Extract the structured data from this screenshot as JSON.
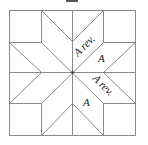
{
  "diagram": {
    "type": "eight-pointed star quilt block",
    "labels": [
      {
        "text": "A rev.",
        "position": "upper-right diamond, inner"
      },
      {
        "text": "A",
        "position": "upper-right diamond, outer"
      },
      {
        "text": "A rev.",
        "position": "lower-right diamond, inner"
      },
      {
        "text": "A",
        "position": "lower-right diamond, outer"
      }
    ],
    "colors": {
      "line": "#8a8a8a",
      "background": "#ffffff",
      "text": "#222222"
    }
  }
}
